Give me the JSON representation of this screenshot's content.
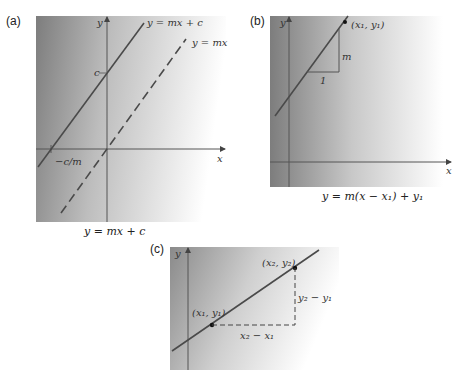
{
  "panels": {
    "a": {
      "label": "(a)",
      "axis_x": "x",
      "axis_y": "y",
      "line1_label": "y = mx + c",
      "line2_label": "y = mx",
      "intercept_label": "c",
      "x_intercept_label": "−c/m",
      "caption": "y = mx + c"
    },
    "b": {
      "label": "(b)",
      "axis_x": "x",
      "axis_y": "y",
      "point_label": "(x₁, y₁)",
      "rise_label": "m",
      "run_label": "1",
      "caption": "y = m(x − x₁) + y₁"
    },
    "c": {
      "label": "(c)",
      "axis_y": "y",
      "point1_label": "(x₁, y₁)",
      "point2_label": "(x₂, y₂)",
      "rise_label": "y₂ − y₁",
      "run_label": "x₂ − x₁"
    }
  },
  "colors": {
    "gradient_dark": "#7a7a7a",
    "gradient_light": "#ffffff",
    "line": "#4a4a4a",
    "axis": "#555555"
  }
}
